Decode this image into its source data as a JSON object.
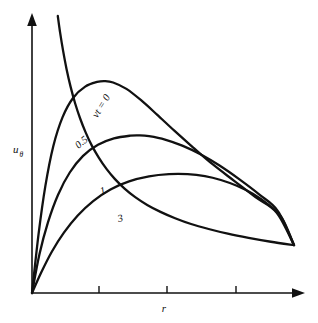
{
  "figure": {
    "background_color": "#ffffff",
    "ink_color": "#111111",
    "width": 318,
    "height": 323
  },
  "chart_data": {
    "type": "line",
    "title": "",
    "subtitle": "",
    "xlabel": "r",
    "ylabel": "uθ",
    "ylabel_base": "u",
    "ylabel_subscript": "θ",
    "grid": false,
    "legend_position": "inline-curve-labels",
    "axis_style": "arrowed-open-axes",
    "xlim": [
      0,
      1
    ],
    "ylim": [
      0,
      1
    ],
    "x_tick_labels": [
      "",
      "",
      ""
    ],
    "x_tick_positions": [
      0.25,
      0.5,
      0.75
    ],
    "y_tick_labels": [],
    "annotations": [
      {
        "name": "curve-label-vt0",
        "text": "vt = 0",
        "rotation": -58,
        "x": 0.245,
        "y": 0.63
      },
      {
        "name": "curve-label-05",
        "text": "0.5",
        "rotation": -40,
        "x": 0.175,
        "y": 0.52
      },
      {
        "name": "curve-label-1",
        "text": "1",
        "rotation": -18,
        "x": 0.26,
        "y": 0.355
      },
      {
        "name": "curve-label-3",
        "text": "3",
        "rotation": -14,
        "x": 0.325,
        "y": 0.255
      }
    ],
    "series": [
      {
        "name": "vt = 0",
        "label": "vt = 0",
        "description": "free vortex, unbounded near axis, decays as 1/r",
        "points": [
          [
            0.097,
            1.0
          ],
          [
            0.106,
            0.938
          ],
          [
            0.117,
            0.874
          ],
          [
            0.13,
            0.808
          ],
          [
            0.145,
            0.745
          ],
          [
            0.162,
            0.685
          ],
          [
            0.181,
            0.63
          ],
          [
            0.202,
            0.579
          ],
          [
            0.225,
            0.532
          ],
          [
            0.251,
            0.489
          ],
          [
            0.28,
            0.448
          ],
          [
            0.312,
            0.411
          ],
          [
            0.348,
            0.377
          ],
          [
            0.388,
            0.346
          ],
          [
            0.433,
            0.318
          ],
          [
            0.483,
            0.293
          ],
          [
            0.538,
            0.27
          ],
          [
            0.598,
            0.249
          ],
          [
            0.664,
            0.231
          ],
          [
            0.736,
            0.214
          ],
          [
            0.814,
            0.199
          ],
          [
            0.898,
            0.185
          ],
          [
            0.985,
            0.173
          ]
        ]
      },
      {
        "name": "0.5",
        "label": "0.5",
        "description": "Lamb-Oseen type profile, peak near r = 0.27",
        "points": [
          [
            0.0,
            0.0
          ],
          [
            0.025,
            0.215
          ],
          [
            0.05,
            0.385
          ],
          [
            0.08,
            0.53
          ],
          [
            0.115,
            0.635
          ],
          [
            0.155,
            0.705
          ],
          [
            0.2,
            0.745
          ],
          [
            0.245,
            0.762
          ],
          [
            0.274,
            0.765
          ],
          [
            0.305,
            0.76
          ],
          [
            0.355,
            0.737
          ],
          [
            0.41,
            0.696
          ],
          [
            0.47,
            0.644
          ],
          [
            0.535,
            0.586
          ],
          [
            0.605,
            0.526
          ],
          [
            0.68,
            0.464
          ],
          [
            0.76,
            0.405
          ],
          [
            0.84,
            0.346
          ],
          [
            0.92,
            0.29
          ],
          [
            0.985,
            0.173
          ]
        ]
      },
      {
        "name": "1",
        "label": "1",
        "description": "broader diffused vortex, peak near r = 0.40",
        "points": [
          [
            0.0,
            0.0
          ],
          [
            0.028,
            0.14
          ],
          [
            0.06,
            0.255
          ],
          [
            0.098,
            0.355
          ],
          [
            0.142,
            0.435
          ],
          [
            0.192,
            0.495
          ],
          [
            0.248,
            0.535
          ],
          [
            0.308,
            0.558
          ],
          [
            0.37,
            0.568
          ],
          [
            0.405,
            0.569
          ],
          [
            0.44,
            0.566
          ],
          [
            0.5,
            0.554
          ],
          [
            0.565,
            0.532
          ],
          [
            0.635,
            0.5
          ],
          [
            0.705,
            0.46
          ],
          [
            0.78,
            0.41
          ],
          [
            0.855,
            0.355
          ],
          [
            0.925,
            0.295
          ],
          [
            0.985,
            0.173
          ]
        ]
      },
      {
        "name": "3",
        "label": "3",
        "description": "most diffused vortex, low flat peak near r = 0.54",
        "points": [
          [
            0.0,
            0.0
          ],
          [
            0.035,
            0.075
          ],
          [
            0.075,
            0.15
          ],
          [
            0.12,
            0.218
          ],
          [
            0.172,
            0.28
          ],
          [
            0.23,
            0.332
          ],
          [
            0.295,
            0.374
          ],
          [
            0.365,
            0.403
          ],
          [
            0.44,
            0.421
          ],
          [
            0.515,
            0.429
          ],
          [
            0.585,
            0.429
          ],
          [
            0.65,
            0.422
          ],
          [
            0.71,
            0.408
          ],
          [
            0.77,
            0.387
          ],
          [
            0.83,
            0.358
          ],
          [
            0.89,
            0.318
          ],
          [
            0.94,
            0.27
          ],
          [
            0.985,
            0.173
          ]
        ]
      }
    ]
  }
}
